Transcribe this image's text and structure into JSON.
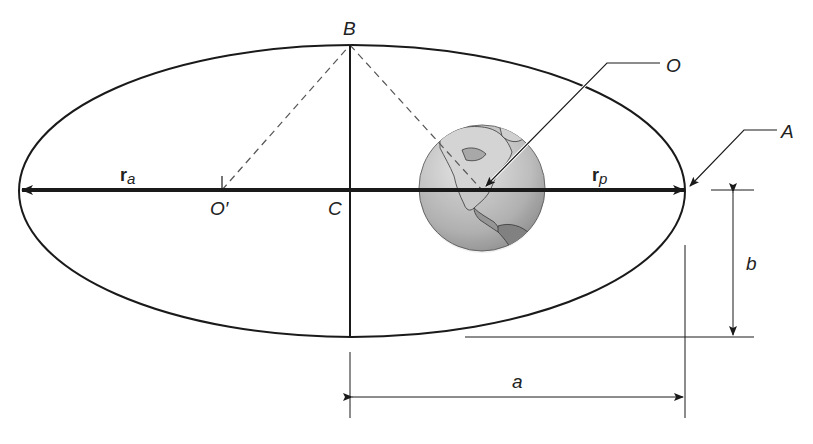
{
  "diagram": {
    "labels": {
      "B": "B",
      "O": "O",
      "A": "A",
      "C": "C",
      "O_prime": "O′",
      "r_a_main": "r",
      "r_a_sub": "a",
      "r_p_main": "r",
      "r_p_sub": "p",
      "a": "a",
      "b": "b"
    },
    "elements": {
      "ellipse": "orbit path",
      "focus_occupied": "Earth (focus O)",
      "focus_empty": "O′",
      "center": "C",
      "apoapsis_vector": "r_a",
      "periapsis_vector": "r_p",
      "semi_major_axis": "a",
      "semi_minor_axis": "b",
      "perigee_point": "A",
      "minor_vertex": "B"
    },
    "colors": {
      "line": "#1a1a1a",
      "dashed": "#555555",
      "earth_land": "#8e8e8e",
      "earth_ocean": "#c8c8c8"
    }
  }
}
